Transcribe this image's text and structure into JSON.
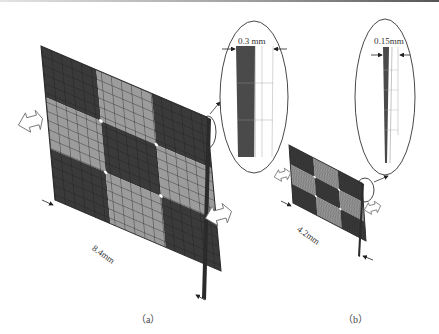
{
  "figure": {
    "panels": [
      {
        "id": "a",
        "caption": "（a）",
        "plate_width_label": "8.4mm",
        "thickness_label": "0.3 mm",
        "grid": "3x3 checkerboard, fine mesh"
      },
      {
        "id": "b",
        "caption": "（b）",
        "plate_width_label": "4.2mm",
        "thickness_label": "0.15mm",
        "grid": "3x3 checkerboard, fine mesh"
      }
    ],
    "colors": {
      "dark_cell": "#3a3a3a",
      "light_cell": "#9c9c9c",
      "mesh_line": "#222222",
      "outline": "#333333"
    },
    "icons": [
      "double-arrow-icon",
      "dimension-arrow-icon",
      "zoom-callout-ellipse"
    ]
  }
}
